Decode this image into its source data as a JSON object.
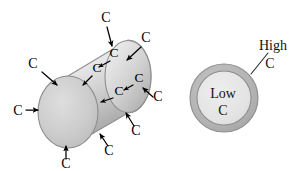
{
  "figure": {
    "background_color": "#ffffff"
  },
  "cylinder": {
    "name": "steel-cylinder",
    "body_fill_light": "#f2f2f2",
    "body_fill_mid": "#d6d6d6",
    "body_fill_dark": "#9a9a9a",
    "face_fill": "#c9c9c9",
    "outline_color": "#8e8e8e",
    "exterior_labels": [
      {
        "id": "c-top",
        "text": "C",
        "x": 106,
        "y": 22
      },
      {
        "id": "c-upper-left",
        "text": "C",
        "x": 33,
        "y": 68
      },
      {
        "id": "c-upper-right",
        "text": "C",
        "x": 146,
        "y": 42
      },
      {
        "id": "c-left",
        "text": "C",
        "x": 18,
        "y": 113
      },
      {
        "id": "c-right",
        "text": "C",
        "x": 158,
        "y": 101
      },
      {
        "id": "c-bottom-left",
        "text": "C",
        "x": 66,
        "y": 166
      },
      {
        "id": "c-bottom-right",
        "text": "C",
        "x": 109,
        "y": 151
      },
      {
        "id": "c-lower-right",
        "text": "C",
        "x": 136,
        "y": 131
      }
    ],
    "surface_labels": [
      {
        "id": "c-surface-1",
        "text": "C",
        "x": 114,
        "y": 57
      },
      {
        "id": "c-surface-2",
        "text": "C",
        "x": 97,
        "y": 72
      },
      {
        "id": "c-surface-3",
        "text": "C",
        "x": 138,
        "y": 82
      },
      {
        "id": "c-surface-4",
        "text": "C",
        "x": 119,
        "y": 95
      }
    ],
    "arrow_count": 12,
    "arrow_color": "#000000"
  },
  "cross_section": {
    "name": "bar-cross-section",
    "center_x": 224,
    "center_y": 98,
    "outer_radius": 34,
    "inner_radius": 27,
    "case_fill": "#b5b5b5",
    "core_fill": "#e4e4e4",
    "outline_color": "#8e8e8e",
    "core_label_line_1": "Low",
    "core_label_line_2": "C",
    "case_label_line_1": "High",
    "case_label_line_2": "C",
    "case_label_x": 272,
    "case_label_y_line_1": 48,
    "case_label_y_line_2": 66,
    "leader_from_x": 252,
    "leader_from_y": 73,
    "leader_to_x": 268,
    "leader_to_y": 52
  }
}
